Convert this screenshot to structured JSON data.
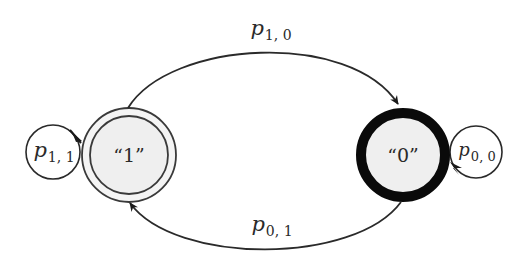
{
  "diagram": {
    "type": "state-transition",
    "states": [
      {
        "id": "state-1",
        "label": "“1”",
        "style": "double-border",
        "fill": "#f0f0f0"
      },
      {
        "id": "state-0",
        "label": "“0”",
        "style": "thick-border",
        "fill": "#f0f0f0"
      }
    ],
    "transitions": [
      {
        "from": "state-1",
        "to": "state-0",
        "symbol": "p",
        "subscript": "1, 0"
      },
      {
        "from": "state-0",
        "to": "state-1",
        "symbol": "p",
        "subscript": "0, 1"
      },
      {
        "from": "state-1",
        "to": "state-1",
        "symbol": "p",
        "subscript": "1, 1"
      },
      {
        "from": "state-0",
        "to": "state-0",
        "symbol": "p",
        "subscript": "0, 0"
      }
    ],
    "colors": {
      "stroke": "#2a2a2a",
      "state_fill": "#f0f0f0",
      "background": "#ffffff"
    }
  }
}
